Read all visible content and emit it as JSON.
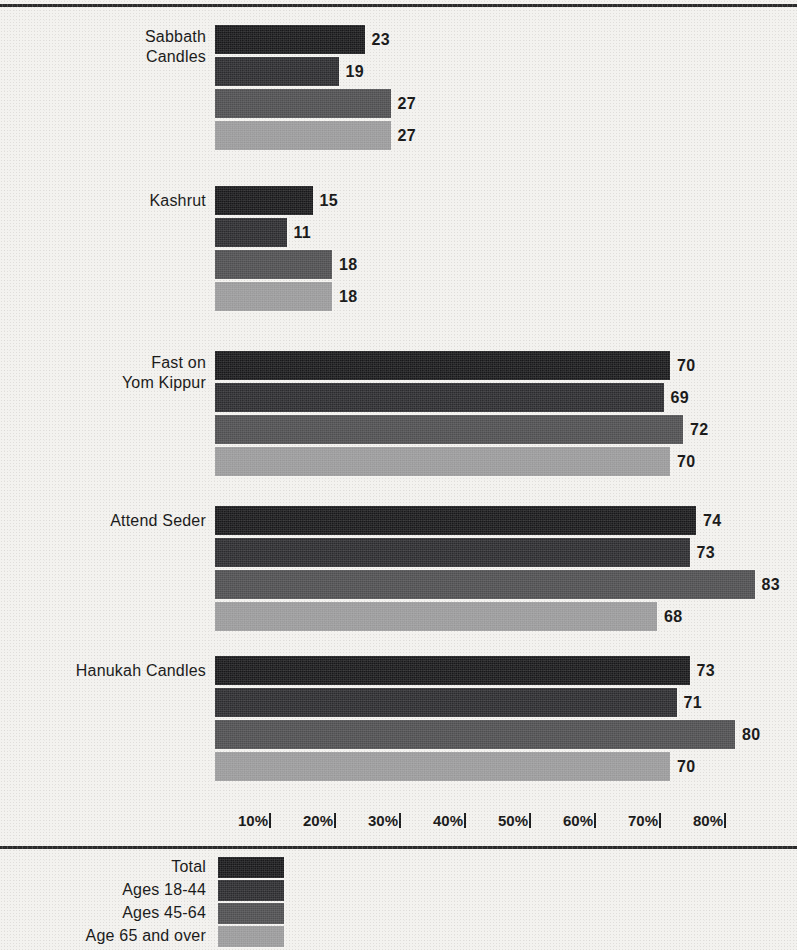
{
  "chart_data": {
    "type": "bar",
    "orientation": "horizontal",
    "title": "",
    "xlabel": "",
    "ylabel": "",
    "xlim": [
      0,
      85
    ],
    "grid": false,
    "legend_position": "bottom",
    "categories": [
      "Sabbath\nCandles",
      "Kashrut",
      "Fast on\nYom Kippur",
      "Attend Seder",
      "Hanukah Candles"
    ],
    "series": [
      {
        "name": "Total",
        "color": "#18181a",
        "values": [
          23,
          15,
          70,
          74,
          73
        ]
      },
      {
        "name": "Ages 18-44",
        "color": "#2b2b2e",
        "values": [
          19,
          11,
          69,
          73,
          71
        ]
      },
      {
        "name": "Ages 45-64",
        "color": "#4e4e50",
        "values": [
          27,
          18,
          72,
          83,
          80
        ]
      },
      {
        "name": "Age 65 and over",
        "color": "#9b9b9c",
        "values": [
          27,
          18,
          70,
          68,
          70
        ]
      }
    ],
    "tick_labels": [
      "10%",
      "20%",
      "30%",
      "40%",
      "50%",
      "60%",
      "70%",
      "80%"
    ],
    "tick_values": [
      10,
      20,
      30,
      40,
      50,
      60,
      70,
      80
    ]
  },
  "legend": {
    "items": [
      {
        "label": "Total",
        "color": "#18181a"
      },
      {
        "label": "Ages 18-44",
        "color": "#2b2b2e"
      },
      {
        "label": "Ages 45-64",
        "color": "#4e4e50"
      },
      {
        "label": "Age 65 and over",
        "color": "#9b9b9c"
      }
    ]
  }
}
